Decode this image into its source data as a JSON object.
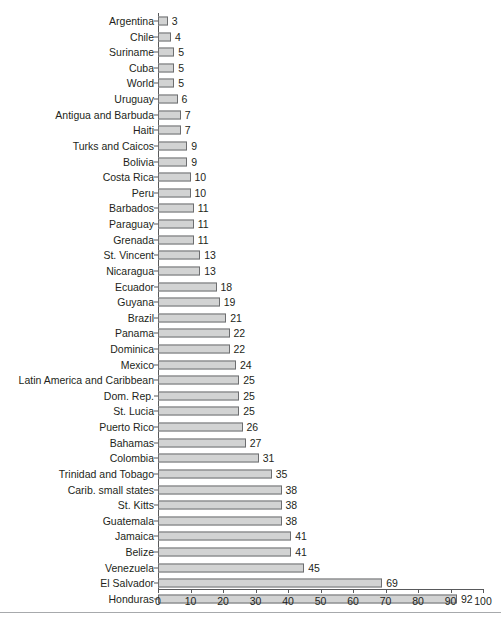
{
  "chart_data": {
    "type": "bar",
    "orientation": "horizontal",
    "title": "",
    "xlabel": "",
    "ylabel": "",
    "xlim": [
      0,
      100
    ],
    "xticks": [
      0,
      10,
      20,
      30,
      40,
      50,
      60,
      70,
      80,
      90,
      100
    ],
    "grid": false,
    "legend": null,
    "bar_fill_color": "#d2d3d3",
    "bar_border_color": "#6d6e70",
    "axis_color": "#58595b",
    "text_color": "#231f20",
    "categories": [
      "Argentina",
      "Chile",
      "Suriname",
      "Cuba",
      "World",
      "Uruguay",
      "Antigua and Barbuda",
      "Haiti",
      "Turks and Caicos",
      "Bolivia",
      "Costa Rica",
      "Peru",
      "Barbados",
      "Paraguay",
      "Grenada",
      "St. Vincent",
      "Nicaragua",
      "Ecuador",
      "Guyana",
      "Brazil",
      "Panama",
      "Dominica",
      "Mexico",
      "Latin America and Caribbean",
      "Dom. Rep.",
      "St. Lucia",
      "Puerto Rico",
      "Bahamas",
      "Colombia",
      "Trinidad and Tobago",
      "Carib. small states",
      "St. Kitts",
      "Guatemala",
      "Jamaica",
      "Belize",
      "Venezuela",
      "El Salvador",
      "Honduras"
    ],
    "values": [
      3,
      4,
      5,
      5,
      5,
      6,
      7,
      7,
      9,
      9,
      10,
      10,
      11,
      11,
      11,
      13,
      13,
      18,
      19,
      21,
      22,
      22,
      24,
      25,
      25,
      25,
      26,
      27,
      31,
      35,
      38,
      38,
      38,
      41,
      41,
      45,
      69,
      92
    ],
    "value_labels": [
      "3",
      "4",
      "5",
      "5",
      "5",
      "6",
      "7",
      "7",
      "9",
      "9",
      "10",
      "10",
      "11",
      "11",
      "11",
      "13",
      "13",
      "18",
      "19",
      "21",
      "22",
      "22",
      "24",
      "25",
      "25",
      "25",
      "26",
      "27",
      "31",
      "35",
      "38",
      "38",
      "38",
      "41",
      "41",
      "45",
      "69",
      "92"
    ],
    "xtick_labels": [
      "0",
      "10",
      "20",
      "30",
      "40",
      "50",
      "60",
      "70",
      "80",
      "90",
      "100"
    ]
  }
}
